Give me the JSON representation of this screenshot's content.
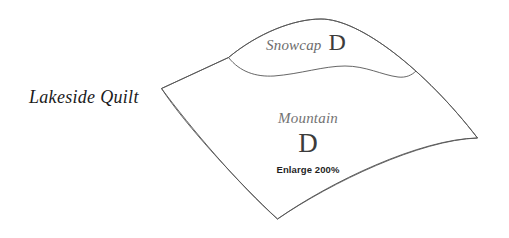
{
  "canvas": {
    "width": 509,
    "height": 238,
    "background_color": "#ffffff"
  },
  "caption": {
    "title": "Lakeside Quilt"
  },
  "diagram": {
    "stroke_color": "#555555",
    "fill_color": "#ffffff",
    "patches": [
      {
        "name": "Snowcap",
        "piece_letter": "D",
        "name_color": "#6d6d6d",
        "piece_color": "#3c3c3c"
      },
      {
        "name": "Mountain",
        "piece_letter": "D",
        "note": "Enlarge 200%",
        "name_color": "#737373",
        "piece_color": "#3c3c3c",
        "note_color": "#1f1f1f"
      }
    ]
  }
}
